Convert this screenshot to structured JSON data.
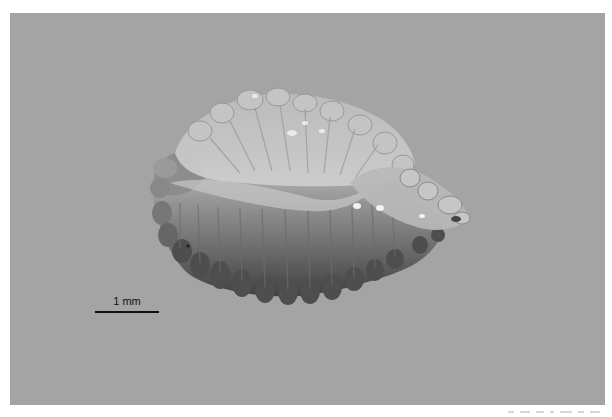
{
  "image": {
    "subject": "translucent radially ribbed specimen (microscope photograph)",
    "background_color": "#a4a4a4",
    "specimen_colors": {
      "highlight": "#d9d9d9",
      "mid": "#9a9a9a",
      "shadow": "#3e3e3e"
    }
  },
  "scale_bar": {
    "label": "1 mm",
    "color": "#111111"
  }
}
